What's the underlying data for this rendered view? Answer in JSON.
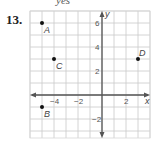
{
  "header": {
    "top_fragment": "yes",
    "problem_number": "13."
  },
  "chart_data": {
    "type": "scatter",
    "title": "",
    "xlabel": "x",
    "ylabel": "y",
    "xlim": [
      -5.5,
      4
    ],
    "ylim": [
      -3.5,
      7
    ],
    "grid": true,
    "x_ticks": [
      {
        "value": -4,
        "label": "−4"
      },
      {
        "value": -2,
        "label": "−2"
      },
      {
        "value": 2,
        "label": "2"
      }
    ],
    "y_ticks": [
      {
        "value": 6,
        "label": "6"
      },
      {
        "value": 4,
        "label": "4"
      },
      {
        "value": 2,
        "label": "2"
      },
      {
        "value": -2,
        "label": "−2"
      }
    ],
    "points": [
      {
        "label": "A",
        "x": -5,
        "y": 6
      },
      {
        "label": "B",
        "x": -5,
        "y": -1
      },
      {
        "label": "C",
        "x": -4,
        "y": 3
      },
      {
        "label": "D",
        "x": 3,
        "y": 3
      }
    ]
  }
}
